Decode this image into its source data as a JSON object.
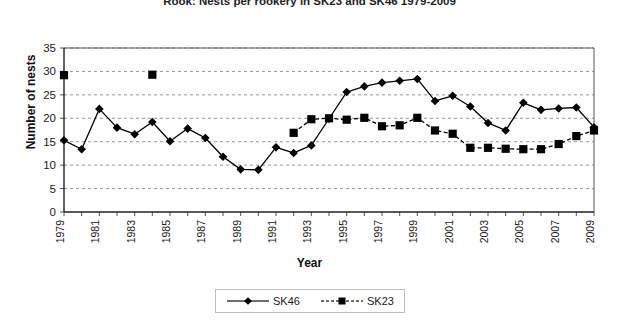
{
  "chart_data": {
    "type": "line",
    "title": "Rook: Nests per rookery in SK23 and SK46 1979-2009",
    "xlabel": "Year",
    "ylabel": "Number of nests",
    "ylim": [
      0,
      35
    ],
    "ytick_step": 5,
    "yticks": [
      0,
      5,
      10,
      15,
      20,
      25,
      30,
      35
    ],
    "xlim": [
      1979,
      2009
    ],
    "xticks": [
      1979,
      1981,
      1983,
      1985,
      1987,
      1989,
      1991,
      1993,
      1995,
      1997,
      1999,
      2001,
      2003,
      2005,
      2007,
      2009
    ],
    "x": [
      1979,
      1980,
      1981,
      1982,
      1983,
      1984,
      1985,
      1986,
      1987,
      1988,
      1989,
      1990,
      1991,
      1992,
      1993,
      1994,
      1995,
      1996,
      1997,
      1998,
      1999,
      2000,
      2001,
      2002,
      2003,
      2004,
      2005,
      2006,
      2007,
      2008,
      2009
    ],
    "grid": true,
    "grid_axis": "y",
    "legend_position": "bottom",
    "series": [
      {
        "name": "SK46",
        "marker": "diamond",
        "linestyle": "solid",
        "color": "#000000",
        "values": [
          15.3,
          13.4,
          22.0,
          18.0,
          16.6,
          19.2,
          15.1,
          17.8,
          15.8,
          11.8,
          9.1,
          9.0,
          13.8,
          12.6,
          14.2,
          19.9,
          25.6,
          26.8,
          27.6,
          28.0,
          28.4,
          23.7,
          24.8,
          22.5,
          19.0,
          17.4,
          23.3,
          21.8,
          22.1,
          22.3,
          18.1
        ]
      },
      {
        "name": "SK23",
        "marker": "square",
        "linestyle": "dashed",
        "color": "#000000",
        "values": [
          29.2,
          null,
          null,
          null,
          null,
          29.3,
          null,
          null,
          null,
          null,
          null,
          null,
          null,
          16.9,
          19.8,
          20.0,
          19.7,
          20.1,
          18.3,
          18.5,
          20.1,
          17.4,
          16.7,
          13.7,
          13.7,
          13.5,
          13.4,
          13.4,
          14.5,
          16.2,
          17.4
        ]
      }
    ],
    "legend": [
      {
        "label": "SK46",
        "marker": "diamond",
        "linestyle": "solid"
      },
      {
        "label": "SK23",
        "marker": "square",
        "linestyle": "dashed"
      }
    ]
  }
}
